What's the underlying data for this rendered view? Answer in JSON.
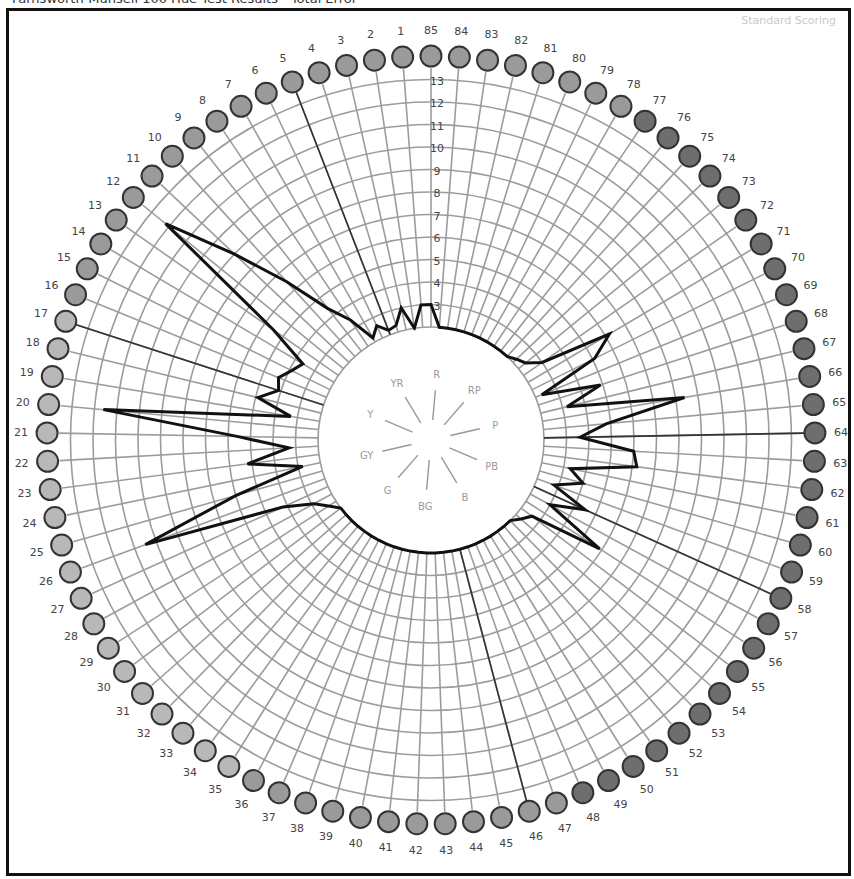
{
  "header": {
    "title": "Farnsworth-Munsell 100 Hue Test Results - Total Error",
    "scoring_mode": "Standard Scoring"
  },
  "chart_data": {
    "type": "radar",
    "title": "Farnsworth-Munsell 100 Hue Test Results",
    "subtitle": "Standard Scoring",
    "num_caps": 85,
    "cap_order_start_top": 85,
    "radial_axis": {
      "ticks": [
        3,
        4,
        5,
        6,
        7,
        8,
        9,
        10,
        11,
        12,
        13
      ],
      "min": 2,
      "max": 13
    },
    "hue_labels": [
      "R",
      "RP",
      "P",
      "PB",
      "B",
      "BG",
      "G",
      "GY",
      "Y",
      "YR"
    ],
    "error_lines_to_caps": [
      5,
      17,
      46,
      58,
      64
    ],
    "cap_scores": {
      "1": 3,
      "2": 2,
      "3": 3,
      "4": 2.3,
      "5": 2.2,
      "6": 2.6,
      "7": 2.2,
      "8": 3.4,
      "9": 4.4,
      "10": 6.5,
      "11": 9,
      "12": 12.2,
      "13": 5.5,
      "14": 3.6,
      "15": 3.9,
      "16": 4.3,
      "17": 4.1,
      "18": 4.9,
      "19": 3.3,
      "20": 11.6,
      "21": 5.6,
      "22": 3.3,
      "23": 5.2,
      "24": 2.8,
      "25": 6,
      "26": 10.5,
      "27": 4.2,
      "28": 2.9,
      "29": 2.4,
      "30": 2,
      "31": 2,
      "32": 2,
      "33": 2,
      "34": 2,
      "35": 2,
      "36": 2,
      "37": 2,
      "38": 2,
      "39": 2,
      "40": 2,
      "41": 2,
      "42": 2,
      "43": 2,
      "44": 2,
      "45": 2,
      "46": 2,
      "47": 2,
      "48": 2,
      "49": 2,
      "50": 2,
      "51": 2,
      "52": 2,
      "53": 2,
      "54": 2.3,
      "55": 2.6,
      "56": 5.9,
      "57": 3,
      "58": 4.5,
      "59": 2.8,
      "60": 4,
      "61": 3.3,
      "62": 6.2,
      "63": 6,
      "64": 3.6,
      "65": 4.8,
      "66": 8.4,
      "67": 3.2,
      "68": 4.9,
      "69": 2.3,
      "70": 5.1,
      "71": 6.2,
      "72": 3,
      "73": 2.4,
      "74": 2.2,
      "75": 2,
      "76": 2,
      "77": 2,
      "78": 2,
      "79": 2,
      "80": 2,
      "81": 2,
      "82": 2,
      "83": 2,
      "84": 2,
      "85": 3
    },
    "cap_colors": {
      "light": "#b8b8b8",
      "mid": "#9a9a9a",
      "dark": "#6e6e6e"
    }
  }
}
